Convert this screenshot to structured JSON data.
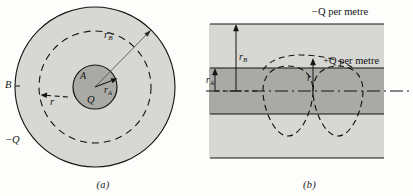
{
  "figure": {
    "panels": [
      {
        "id": "a",
        "caption": "(a)",
        "labels": {
          "conductor_inner": "A",
          "charge_inner": "Q",
          "conductor_outer": "B",
          "charge_outer_prefix": "−",
          "charge_outer": "Q",
          "radius_inner_base": "r",
          "radius_inner_sub": "A",
          "radius_outer_base": "r",
          "radius_outer_sub": "B",
          "radius_gauss": "r"
        }
      },
      {
        "id": "b",
        "caption": "(b)",
        "labels": {
          "charge_top": "−Q per metre",
          "charge_mid": "+Q per metre",
          "radius_outer_base": "r",
          "radius_outer_sub": "B",
          "radius_inner_base": "r",
          "radius_inner_sub": "A",
          "radius_gauss": "r"
        }
      }
    ],
    "colors": {
      "ink": "#141414",
      "outer_fill": "#d6d6d2",
      "inner_fill": "#a8a8a4",
      "page": "#fdfdfc",
      "dashed_stroke": "#141414"
    }
  }
}
